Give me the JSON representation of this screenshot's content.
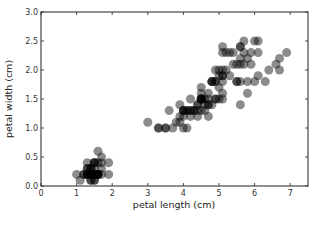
{
  "chart_data": {
    "type": "scatter",
    "title": "",
    "xlabel": "petal length (cm)",
    "ylabel": "petal width (cm)",
    "xlim": [
      0,
      7.5
    ],
    "ylim": [
      0,
      3.0
    ],
    "xticks": [
      0,
      1,
      2,
      3,
      4,
      5,
      6,
      7
    ],
    "xtick_labels": [
      "0",
      "1",
      "2",
      "3",
      "4",
      "5",
      "6",
      "7"
    ],
    "yticks": [
      0.0,
      0.5,
      1.0,
      1.5,
      2.0,
      2.5,
      3.0
    ],
    "ytick_labels": [
      "0.0",
      "0.5",
      "1.0",
      "1.5",
      "2.0",
      "2.5",
      "3.0"
    ],
    "grid": false,
    "legend": null,
    "marker_color": "#000000",
    "marker_alpha": 0.45,
    "marker_radius_px": 4.5,
    "series": [
      {
        "name": "iris petals",
        "x": [
          1.4,
          1.4,
          1.3,
          1.5,
          1.4,
          1.7,
          1.4,
          1.5,
          1.4,
          1.5,
          1.5,
          1.6,
          1.4,
          1.1,
          1.2,
          1.5,
          1.3,
          1.4,
          1.7,
          1.5,
          1.7,
          1.5,
          1.0,
          1.7,
          1.9,
          1.6,
          1.6,
          1.5,
          1.4,
          1.6,
          1.6,
          1.5,
          1.5,
          1.4,
          1.5,
          1.2,
          1.3,
          1.4,
          1.3,
          1.5,
          1.3,
          1.3,
          1.3,
          1.6,
          1.9,
          1.4,
          1.6,
          1.4,
          1.5,
          1.4,
          4.7,
          4.5,
          4.9,
          4.0,
          4.6,
          4.5,
          4.7,
          3.3,
          4.6,
          3.9,
          3.5,
          4.2,
          4.0,
          4.7,
          3.6,
          4.4,
          4.5,
          4.1,
          4.5,
          3.9,
          4.8,
          4.0,
          4.9,
          4.7,
          4.3,
          4.4,
          4.8,
          5.0,
          4.5,
          3.5,
          3.8,
          3.7,
          3.9,
          5.1,
          4.5,
          4.5,
          4.7,
          4.4,
          4.1,
          4.0,
          4.4,
          4.6,
          4.0,
          3.3,
          4.2,
          4.2,
          4.2,
          4.3,
          3.0,
          4.1,
          6.0,
          5.1,
          5.9,
          5.6,
          5.8,
          6.6,
          4.5,
          6.3,
          5.8,
          6.1,
          5.1,
          5.3,
          5.5,
          5.0,
          5.1,
          5.3,
          5.5,
          6.7,
          6.9,
          5.0,
          5.7,
          4.9,
          6.7,
          4.9,
          5.7,
          6.0,
          4.8,
          4.9,
          5.6,
          5.8,
          6.1,
          6.4,
          5.6,
          5.1,
          5.6,
          6.1,
          5.6,
          5.5,
          4.8,
          5.4,
          5.6,
          5.1,
          5.1,
          5.9,
          5.7,
          5.2,
          5.0,
          5.2,
          5.4,
          5.1
        ],
        "y": [
          0.2,
          0.2,
          0.2,
          0.2,
          0.2,
          0.4,
          0.3,
          0.2,
          0.2,
          0.1,
          0.2,
          0.2,
          0.1,
          0.1,
          0.2,
          0.4,
          0.4,
          0.3,
          0.3,
          0.3,
          0.2,
          0.4,
          0.2,
          0.5,
          0.2,
          0.2,
          0.4,
          0.2,
          0.2,
          0.2,
          0.2,
          0.4,
          0.1,
          0.2,
          0.2,
          0.2,
          0.2,
          0.1,
          0.2,
          0.2,
          0.3,
          0.3,
          0.2,
          0.6,
          0.4,
          0.3,
          0.2,
          0.2,
          0.2,
          0.2,
          1.4,
          1.5,
          1.5,
          1.3,
          1.5,
          1.3,
          1.6,
          1.0,
          1.3,
          1.4,
          1.0,
          1.5,
          1.0,
          1.4,
          1.3,
          1.4,
          1.5,
          1.0,
          1.5,
          1.1,
          1.8,
          1.3,
          1.5,
          1.2,
          1.3,
          1.4,
          1.4,
          1.7,
          1.5,
          1.0,
          1.1,
          1.0,
          1.2,
          1.6,
          1.5,
          1.6,
          1.5,
          1.3,
          1.3,
          1.3,
          1.2,
          1.4,
          1.2,
          1.0,
          1.3,
          1.2,
          1.3,
          1.3,
          1.1,
          1.3,
          2.5,
          1.9,
          2.1,
          1.8,
          2.2,
          2.1,
          1.7,
          1.8,
          1.8,
          2.5,
          2.0,
          1.9,
          2.1,
          2.0,
          2.4,
          2.3,
          1.8,
          2.2,
          2.3,
          1.5,
          2.3,
          2.0,
          2.0,
          1.8,
          2.1,
          1.8,
          1.8,
          1.8,
          2.1,
          1.6,
          1.9,
          2.0,
          2.2,
          1.5,
          1.4,
          2.3,
          2.4,
          1.8,
          1.8,
          2.1,
          2.4,
          2.3,
          1.9,
          2.3,
          2.5,
          2.3,
          1.9,
          2.0,
          2.3,
          1.8
        ]
      }
    ]
  },
  "watermark": " "
}
